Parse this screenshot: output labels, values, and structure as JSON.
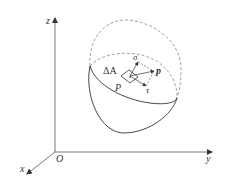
{
  "figure": {
    "axes": {
      "origin_label": "O",
      "x_label": "x",
      "y_label": "y",
      "z_label": "z"
    },
    "labels": {
      "area": "ΔA",
      "point": "P",
      "normal_stress": "σ",
      "total_stress": "p",
      "shear_stress": "τ"
    },
    "colors": {
      "line": "#333333",
      "dashed": "#888888",
      "background": "#ffffff"
    }
  }
}
